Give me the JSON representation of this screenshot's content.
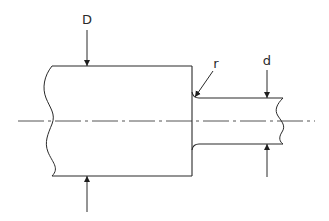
{
  "diagram": {
    "type": "stepped-shaft-with-fillet",
    "labels": {
      "large_diameter": "D",
      "small_diameter": "d",
      "fillet_radius": "r"
    },
    "colors": {
      "line": "#2a2a2a",
      "centerline": "#555555",
      "background": "#ffffff"
    }
  }
}
